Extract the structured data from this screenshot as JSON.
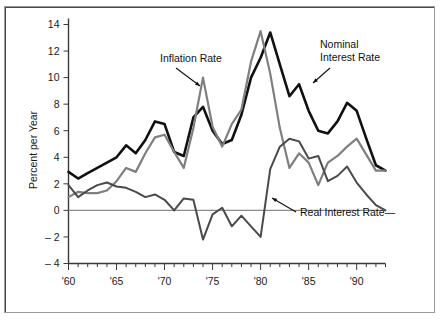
{
  "figure": {
    "name": "interest-rates-and-inflation-chart",
    "background": "#ffffff",
    "frame_color": "#9a9a9a"
  },
  "chart_data": {
    "type": "line",
    "title": "",
    "xlabel": "",
    "ylabel": "Percent per Year",
    "xlim": [
      1960,
      1993
    ],
    "ylim": [
      -4,
      14
    ],
    "ytick_values": [
      -4,
      -2,
      0,
      2,
      4,
      6,
      8,
      10,
      12,
      14
    ],
    "ytick_labels": [
      "– 4",
      "– 2",
      "0",
      "2",
      "4",
      "6",
      "8",
      "10",
      "12",
      "14"
    ],
    "xtick_values": [
      1960,
      1965,
      1970,
      1975,
      1980,
      1985,
      1990
    ],
    "xtick_labels": [
      "'60",
      "'65",
      "'70",
      "'75",
      "'80",
      "'85",
      "'90"
    ],
    "minor_xticks_every": 1,
    "grid": false,
    "zero_line": true,
    "legend_position": "inline-annotations",
    "x": [
      1960,
      1961,
      1962,
      1963,
      1964,
      1965,
      1966,
      1967,
      1968,
      1969,
      1970,
      1971,
      1972,
      1973,
      1974,
      1975,
      1976,
      1977,
      1978,
      1979,
      1980,
      1981,
      1982,
      1983,
      1984,
      1985,
      1986,
      1987,
      1988,
      1989,
      1990,
      1991,
      1992,
      1993
    ],
    "series": [
      {
        "name": "Nominal Interest Rate",
        "color": "#111111",
        "width": 2.6,
        "values": [
          2.9,
          2.4,
          2.8,
          3.2,
          3.6,
          4.0,
          4.9,
          4.3,
          5.3,
          6.7,
          6.5,
          4.4,
          4.1,
          7.0,
          7.8,
          6.0,
          5.0,
          5.3,
          7.2,
          10.0,
          11.5,
          13.4,
          11.0,
          8.6,
          9.5,
          7.5,
          6.0,
          5.8,
          6.7,
          8.1,
          7.5,
          5.4,
          3.4,
          3.0
        ]
      },
      {
        "name": "Inflation Rate",
        "color": "#7f7f7f",
        "width": 2.2,
        "values": [
          1.0,
          1.4,
          1.3,
          1.3,
          1.5,
          2.2,
          3.2,
          2.9,
          4.3,
          5.5,
          5.7,
          4.4,
          3.2,
          6.2,
          10.0,
          6.3,
          4.8,
          6.5,
          7.6,
          11.2,
          13.5,
          10.3,
          6.2,
          3.2,
          4.3,
          3.6,
          1.9,
          3.6,
          4.1,
          4.8,
          5.4,
          4.2,
          3.0,
          3.0
        ]
      },
      {
        "name": "Real Interest Rate",
        "color": "#4a4a4a",
        "width": 2.0,
        "values": [
          1.9,
          1.0,
          1.5,
          1.9,
          2.1,
          1.8,
          1.7,
          1.4,
          1.0,
          1.2,
          0.8,
          0.0,
          0.9,
          0.8,
          -2.2,
          -0.3,
          0.2,
          -1.2,
          -0.4,
          -1.2,
          -2.0,
          3.1,
          4.8,
          5.4,
          5.2,
          3.9,
          4.1,
          2.2,
          2.6,
          3.3,
          2.1,
          1.2,
          0.4,
          0.0
        ]
      }
    ],
    "annotations": [
      {
        "text": "Inflation Rate",
        "target_year": 1974,
        "target_value": 10.0
      },
      {
        "text": "Nominal\nInterest Rate",
        "target_year": 1984,
        "target_value": 9.5
      },
      {
        "text": "Real Interest Rate—",
        "target_year": 1981,
        "target_value": 3.1
      }
    ]
  },
  "labels": {
    "y_axis_title": "Percent per Year",
    "inflation": "Inflation Rate",
    "nominal_line1": "Nominal",
    "nominal_line2": "Interest Rate",
    "real": "Real Interest Rate—"
  }
}
